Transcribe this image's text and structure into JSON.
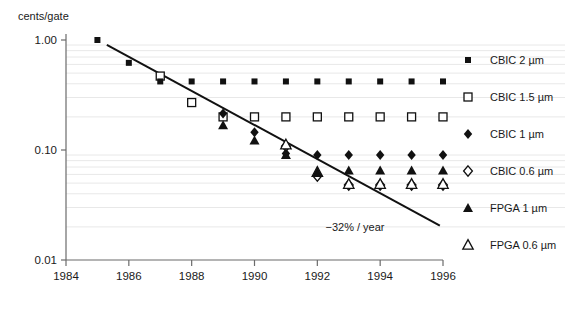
{
  "chart_data": {
    "type": "scatter",
    "title": "",
    "subtitle": "",
    "xlabel": "",
    "ylabel": "cents/gate",
    "yscale": "log",
    "ylim": [
      0.01,
      1.0
    ],
    "xlim": [
      1984,
      1996
    ],
    "ytick_labels": [
      "1.00",
      "0.10",
      "0.01"
    ],
    "ytick_values": [
      1.0,
      0.1,
      0.01
    ],
    "xtick_labels": [
      "1984",
      "1986",
      "1988",
      "1990",
      "1992",
      "1994",
      "1996"
    ],
    "xtick_values": [
      1984,
      1986,
      1988,
      1990,
      1992,
      1994,
      1996
    ],
    "grid": "minor-horizontal-log",
    "legend_position": "right",
    "annotations": [
      {
        "text": "−32% / year",
        "x": 1993.2,
        "y": 0.0185
      }
    ],
    "trendline": {
      "label": "−32% / year",
      "slope_percent_per_year": -32,
      "x_start": 1985.3,
      "y_start": 0.905,
      "x_end": 1995.9,
      "y_end": 0.0205
    },
    "series": [
      {
        "name": "CBIC 2 µm",
        "marker": "filled-square",
        "color": "#111111",
        "points": [
          {
            "x": 1985,
            "y": 1.0
          },
          {
            "x": 1986,
            "y": 0.62
          },
          {
            "x": 1987,
            "y": 0.42
          },
          {
            "x": 1988,
            "y": 0.42
          },
          {
            "x": 1989,
            "y": 0.42
          },
          {
            "x": 1990,
            "y": 0.42
          },
          {
            "x": 1991,
            "y": 0.42
          },
          {
            "x": 1992,
            "y": 0.42
          },
          {
            "x": 1993,
            "y": 0.42
          },
          {
            "x": 1994,
            "y": 0.42
          },
          {
            "x": 1995,
            "y": 0.42
          },
          {
            "x": 1996,
            "y": 0.42
          }
        ]
      },
      {
        "name": "CBIC 1.5 µm",
        "marker": "open-square",
        "color": "#111111",
        "points": [
          {
            "x": 1987,
            "y": 0.47
          },
          {
            "x": 1988,
            "y": 0.27
          },
          {
            "x": 1989,
            "y": 0.2
          },
          {
            "x": 1990,
            "y": 0.2
          },
          {
            "x": 1991,
            "y": 0.2
          },
          {
            "x": 1992,
            "y": 0.2
          },
          {
            "x": 1993,
            "y": 0.2
          },
          {
            "x": 1994,
            "y": 0.2
          },
          {
            "x": 1995,
            "y": 0.2
          },
          {
            "x": 1996,
            "y": 0.2
          }
        ]
      },
      {
        "name": "CBIC 1 µm",
        "marker": "filled-diamond",
        "color": "#111111",
        "points": [
          {
            "x": 1989,
            "y": 0.215
          },
          {
            "x": 1990,
            "y": 0.145
          },
          {
            "x": 1991,
            "y": 0.093
          },
          {
            "x": 1992,
            "y": 0.09
          },
          {
            "x": 1993,
            "y": 0.09
          },
          {
            "x": 1994,
            "y": 0.09
          },
          {
            "x": 1995,
            "y": 0.09
          },
          {
            "x": 1996,
            "y": 0.09
          }
        ]
      },
      {
        "name": "CBIC 0.6 µm",
        "marker": "open-diamond",
        "color": "#111111",
        "points": [
          {
            "x": 1991,
            "y": 0.108
          },
          {
            "x": 1992,
            "y": 0.058
          },
          {
            "x": 1993,
            "y": 0.048
          },
          {
            "x": 1994,
            "y": 0.048
          },
          {
            "x": 1995,
            "y": 0.048
          },
          {
            "x": 1996,
            "y": 0.048
          }
        ]
      },
      {
        "name": "FPGA 1 µm",
        "marker": "filled-triangle",
        "color": "#111111",
        "points": [
          {
            "x": 1989,
            "y": 0.168
          },
          {
            "x": 1990,
            "y": 0.122
          },
          {
            "x": 1991,
            "y": 0.09
          },
          {
            "x": 1992,
            "y": 0.063
          },
          {
            "x": 1993,
            "y": 0.065
          },
          {
            "x": 1994,
            "y": 0.065
          },
          {
            "x": 1995,
            "y": 0.065
          },
          {
            "x": 1996,
            "y": 0.065
          }
        ]
      },
      {
        "name": "FPGA 0.6 µm",
        "marker": "open-triangle",
        "color": "#111111",
        "points": [
          {
            "x": 1991,
            "y": 0.112
          },
          {
            "x": 1992,
            "y": 0.063
          },
          {
            "x": 1993,
            "y": 0.049
          },
          {
            "x": 1994,
            "y": 0.049
          },
          {
            "x": 1995,
            "y": 0.049
          },
          {
            "x": 1996,
            "y": 0.049
          }
        ]
      }
    ]
  }
}
